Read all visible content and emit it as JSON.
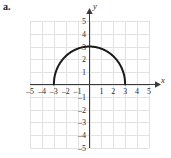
{
  "figure": {
    "part_label": "a.",
    "background_color": "#ffffff",
    "grid_color": "#e2e2e2",
    "axis_color": "#3a3a3a",
    "curve_color": "#1a1a1a",
    "tick_text_color": "#2a2a2a"
  },
  "chart_data": {
    "type": "line",
    "title": "",
    "xlabel": "x",
    "ylabel": "y",
    "xlim": [
      -5,
      5
    ],
    "ylim": [
      -5,
      5
    ],
    "grid": true,
    "legend": "none",
    "x_ticks": [
      -5,
      -4,
      -3,
      -2,
      -1,
      1,
      2,
      3,
      4,
      5
    ],
    "y_ticks": [
      5,
      4,
      3,
      2,
      1,
      -1,
      -2,
      -3,
      -4,
      -5
    ],
    "x_tick_labels": [
      "-5",
      "-4",
      "-3",
      "-2",
      "-1",
      "1",
      "2",
      "3",
      "4",
      "5"
    ],
    "y_tick_labels": [
      "5",
      "4",
      "3",
      "2",
      "1",
      "-1",
      "-2",
      "-3",
      "-4",
      "-5"
    ],
    "series": [
      {
        "name": "upper semicircle radius 3",
        "equation": "y = sqrt(9 - x^2)",
        "domain": [
          -3,
          3
        ],
        "range": [
          0,
          3
        ],
        "x": [
          -3,
          -2.5,
          -2,
          -1.5,
          -1,
          -0.5,
          0,
          0.5,
          1,
          1.5,
          2,
          2.5,
          3
        ],
        "y": [
          0,
          1.66,
          2.24,
          2.6,
          2.83,
          2.96,
          3,
          2.96,
          2.83,
          2.6,
          2.24,
          1.66,
          0
        ]
      }
    ],
    "annotations": []
  },
  "axis_labels": {
    "x": "x",
    "y": "y"
  }
}
